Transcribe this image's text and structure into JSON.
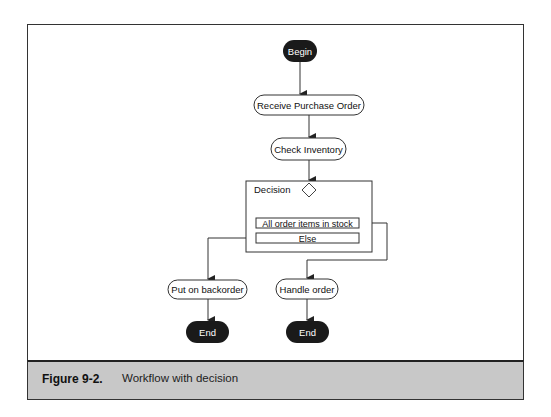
{
  "diagram": {
    "nodes": {
      "begin": "Begin",
      "receive_po": "Receive Purchase Order",
      "check_inventory": "Check Inventory",
      "decision_label": "Decision",
      "condition_in_stock": "All order items in stock",
      "condition_else": "Else",
      "put_on_backorder": "Put on backorder",
      "handle_order": "Handle order",
      "end_left": "End",
      "end_right": "End"
    },
    "colors": {
      "terminal_fill": "#1a1a1a",
      "caption_bg": "#c8c8c8",
      "line": "#333333"
    }
  },
  "caption": {
    "label": "Figure 9-2.",
    "text": "Workflow with decision"
  }
}
